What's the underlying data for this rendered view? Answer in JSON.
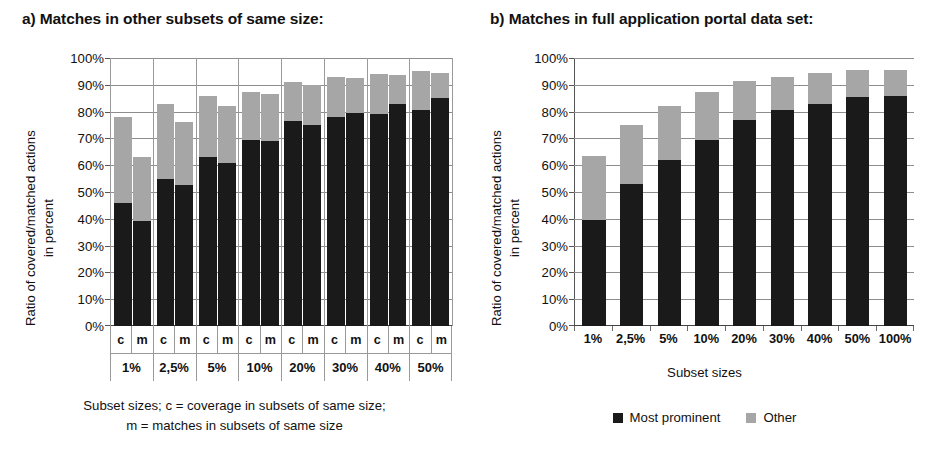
{
  "figure": {
    "background": "#ffffff",
    "colors": {
      "main": "#1a1a1a",
      "other": "#a6a6a6",
      "grid": "#8d8d8d",
      "text": "#111111"
    }
  },
  "panel_a": {
    "title": "a) Matches in other subsets of same size:",
    "ylabel_line1": "Ratio of covered/matched actions",
    "ylabel_line2": "in percent",
    "caption_line1": "Subset sizes; c = coverage in subsets of same size;",
    "caption_line2": "m = matches in subsets of same size",
    "yticks": [
      "100%",
      "90%",
      "80%",
      "70%",
      "60%",
      "50%",
      "40%",
      "30%",
      "20%",
      "10%",
      "0%"
    ],
    "sub_labels": [
      "c",
      "m"
    ],
    "categories": [
      "1%",
      "2,5%",
      "5%",
      "10%",
      "20%",
      "30%",
      "40%",
      "50%"
    ]
  },
  "panel_b": {
    "title": "b) Matches in full application portal data set:",
    "ylabel_line1": "Ratio of covered/matched actions",
    "ylabel_line2": "in percent",
    "xaxis_title": "Subset sizes",
    "yticks": [
      "100%",
      "90%",
      "80%",
      "70%",
      "60%",
      "50%",
      "40%",
      "30%",
      "20%",
      "10%",
      "0%"
    ],
    "categories": [
      "1%",
      "2,5%",
      "5%",
      "10%",
      "20%",
      "30%",
      "40%",
      "50%",
      "100%"
    ]
  },
  "legend": {
    "items": [
      {
        "label": "Most prominent",
        "color": "#1a1a1a"
      },
      {
        "label": "Other",
        "color": "#a6a6a6"
      }
    ]
  },
  "chart_data": [
    {
      "id": "panel_a",
      "type": "bar",
      "stacked": true,
      "title": "a) Matches in other subsets of same size:",
      "xlabel": "Subset sizes; c = coverage in subsets of same size; m = matches in subsets of same size",
      "ylabel": "Ratio of covered/matched actions in percent",
      "ylim": [
        0,
        100
      ],
      "ytick_values": [
        0,
        10,
        20,
        30,
        40,
        50,
        60,
        70,
        80,
        90,
        100
      ],
      "grid": true,
      "legend_position": "bottom-right (shared)",
      "categories": [
        "1%",
        "2,5%",
        "5%",
        "10%",
        "20%",
        "30%",
        "40%",
        "50%"
      ],
      "subcategories": [
        "c",
        "m"
      ],
      "series": [
        {
          "name": "Most prominent",
          "color": "#1a1a1a",
          "values_c": [
            46,
            55,
            63,
            69.5,
            76.5,
            78,
            79,
            80.5
          ],
          "values_m": [
            39,
            52.5,
            61,
            69,
            75,
            79.5,
            83,
            85
          ]
        },
        {
          "name": "Other",
          "color": "#a6a6a6",
          "values_c": [
            32,
            28,
            23,
            18,
            14.5,
            15,
            15,
            14.5
          ],
          "values_m": [
            24,
            23.5,
            21,
            17.5,
            15,
            13,
            10.5,
            9.5
          ]
        }
      ],
      "totals_c": [
        78,
        83,
        86,
        87.5,
        91,
        93,
        94,
        95
      ],
      "totals_m": [
        63,
        76,
        82,
        86.5,
        90,
        92.5,
        93.5,
        94.5
      ]
    },
    {
      "id": "panel_b",
      "type": "bar",
      "stacked": true,
      "title": "b) Matches in full application portal data set:",
      "xlabel": "Subset sizes",
      "ylabel": "Ratio of covered/matched actions in percent",
      "ylim": [
        0,
        100
      ],
      "ytick_values": [
        0,
        10,
        20,
        30,
        40,
        50,
        60,
        70,
        80,
        90,
        100
      ],
      "grid": true,
      "legend_position": "bottom",
      "categories": [
        "1%",
        "2,5%",
        "5%",
        "10%",
        "20%",
        "30%",
        "40%",
        "50%",
        "100%"
      ],
      "series": [
        {
          "name": "Most prominent",
          "color": "#1a1a1a",
          "values": [
            39.5,
            53,
            62,
            69.5,
            77,
            80.5,
            83,
            85.5,
            86
          ]
        },
        {
          "name": "Other",
          "color": "#a6a6a6",
          "values": [
            24,
            22,
            20,
            18,
            14.5,
            12.5,
            11.5,
            10,
            9.5
          ]
        }
      ],
      "totals": [
        63.5,
        75,
        82,
        87.5,
        91.5,
        93,
        94.5,
        95.5,
        95.5
      ]
    }
  ]
}
